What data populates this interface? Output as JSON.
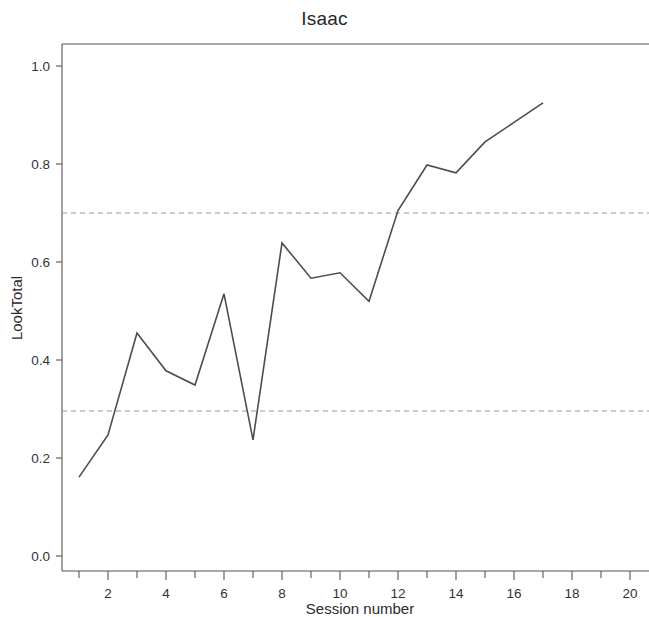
{
  "figure": {
    "title": "Isaac",
    "background_color": "#ffffff",
    "line_color": "#4d4d4d",
    "axis_color": "#555555",
    "threshold_color": "#9a9a9a"
  },
  "chart_data": {
    "type": "line",
    "title": "Isaac",
    "xlabel": "Session number",
    "ylabel": "LookTotal",
    "x": [
      1,
      2,
      3,
      4,
      5,
      6,
      7,
      8,
      9,
      10,
      11,
      12,
      13,
      14,
      15,
      16,
      17
    ],
    "values": [
      0.161,
      0.247,
      0.455,
      0.378,
      0.349,
      0.535,
      0.237,
      0.639,
      0.567,
      0.578,
      0.52,
      0.705,
      0.798,
      0.782,
      0.845,
      0.885,
      0.925
    ],
    "series": [
      {
        "name": "LookTotal",
        "values": [
          0.161,
          0.247,
          0.455,
          0.378,
          0.349,
          0.535,
          0.237,
          0.639,
          0.567,
          0.578,
          0.52,
          0.705,
          0.798,
          0.782,
          0.845,
          0.885,
          0.925
        ]
      }
    ],
    "xlim": [
      0.3,
      21.3
    ],
    "ylim": [
      -0.03,
      1.06
    ],
    "xticks": [
      2,
      4,
      6,
      8,
      10,
      12,
      14,
      16,
      18,
      20
    ],
    "xtick_labels": [
      "2",
      "4",
      "6",
      "8",
      "10",
      "12",
      "14",
      "16",
      "18",
      "20"
    ],
    "xminor_ticks": [
      1,
      3,
      5,
      7,
      9,
      11,
      13,
      15,
      17,
      19,
      21
    ],
    "yticks": [
      0.0,
      0.2,
      0.4,
      0.6,
      0.8,
      1.0
    ],
    "ytick_labels": [
      "0.0",
      "0.2",
      "0.4",
      "0.6",
      "0.8",
      "1.0"
    ],
    "grid": false,
    "legend": "none",
    "annotations": [
      {
        "type": "hline",
        "label": "upper criterion",
        "value": 0.7,
        "style": "dashed"
      },
      {
        "type": "hline",
        "label": "lower criterion",
        "value": 0.3,
        "style": "dashed"
      }
    ]
  }
}
